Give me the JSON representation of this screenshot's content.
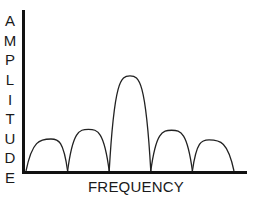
{
  "chart_data": {
    "type": "line",
    "title": "",
    "xlabel": "FREQUENCY",
    "ylabel": "AMPLITUDE",
    "ylabel_letters": [
      "A",
      "M",
      "P",
      "L",
      "I",
      "T",
      "U",
      "D",
      "E"
    ],
    "grid": false,
    "legend": null,
    "xlim": [
      0,
      10
    ],
    "ylim": [
      0,
      1
    ],
    "lobes": [
      {
        "name": "side-lobe-left-2",
        "start": 0.0,
        "end": 2.0,
        "peak_x": 1.2,
        "peak": 0.33
      },
      {
        "name": "side-lobe-left-1",
        "start": 2.0,
        "end": 4.0,
        "peak_x": 3.0,
        "peak": 0.43
      },
      {
        "name": "main-lobe",
        "start": 4.0,
        "end": 6.0,
        "peak_x": 5.0,
        "peak": 0.98
      },
      {
        "name": "side-lobe-right-1",
        "start": 6.0,
        "end": 8.0,
        "peak_x": 7.0,
        "peak": 0.42
      },
      {
        "name": "side-lobe-right-2",
        "start": 8.0,
        "end": 10.0,
        "peak_x": 8.8,
        "peak": 0.32
      }
    ],
    "colors": {
      "axis": "#111111",
      "curve": "#222222",
      "text": "#1a1a1a"
    }
  },
  "labels": {
    "x_axis": "FREQUENCY",
    "y_axis": [
      "A",
      "M",
      "P",
      "L",
      "I",
      "T",
      "U",
      "D",
      "E"
    ]
  }
}
